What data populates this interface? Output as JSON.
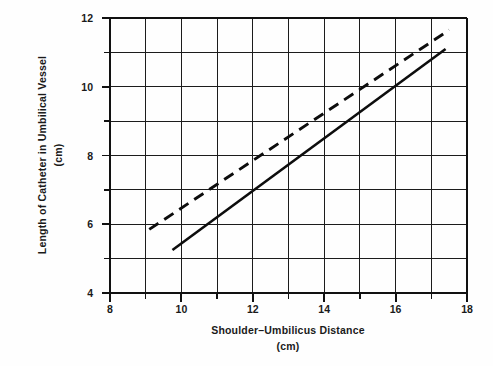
{
  "chart_data": {
    "type": "line",
    "title": "",
    "subtitle": "",
    "xlabel": "Shoulder–Umbilicus Distance",
    "xlabel_units": "(cm)",
    "ylabel": "Length of Catheter in Umbilical Vessel",
    "ylabel_units": "(cm)",
    "xlim": [
      8,
      18
    ],
    "ylim": [
      4,
      12
    ],
    "grid": true,
    "grid_x_step": 1,
    "grid_y_step": 1,
    "legend": "none",
    "x_ticks": [
      8,
      9,
      10,
      11,
      12,
      13,
      14,
      15,
      16,
      17,
      18
    ],
    "x_tick_labels": [
      "8",
      "",
      "10",
      "",
      "12",
      "",
      "14",
      "",
      "16",
      "",
      "18"
    ],
    "y_ticks": [
      4,
      5,
      6,
      7,
      8,
      9,
      10,
      11,
      12
    ],
    "y_tick_labels": [
      "4",
      "",
      "6",
      "",
      "8",
      "",
      "10",
      "",
      "12"
    ],
    "series": [
      {
        "name": "umbilical-vein-catheter",
        "style": "dashed",
        "color": "#0d0d0d",
        "x": [
          9.1,
          17.5
        ],
        "y": [
          5.85,
          11.65
        ]
      },
      {
        "name": "umbilical-artery-catheter",
        "style": "solid",
        "color": "#0d0d0d",
        "x": [
          9.75,
          17.4
        ],
        "y": [
          5.25,
          11.1
        ]
      }
    ]
  },
  "axes": {
    "x_label_main": "Shoulder–Umbilicus Distance",
    "x_label_units": "(cm)",
    "y_label_main": "Length of Catheter in Umbilical Vessel",
    "y_label_units": "(cm)"
  },
  "x_labels": {
    "t0": "8",
    "t2": "10",
    "t4": "12",
    "t6": "14",
    "t8": "16",
    "t10": "18"
  },
  "y_labels": {
    "t0": "4",
    "t2": "6",
    "t4": "8",
    "t6": "10",
    "t8": "12"
  }
}
